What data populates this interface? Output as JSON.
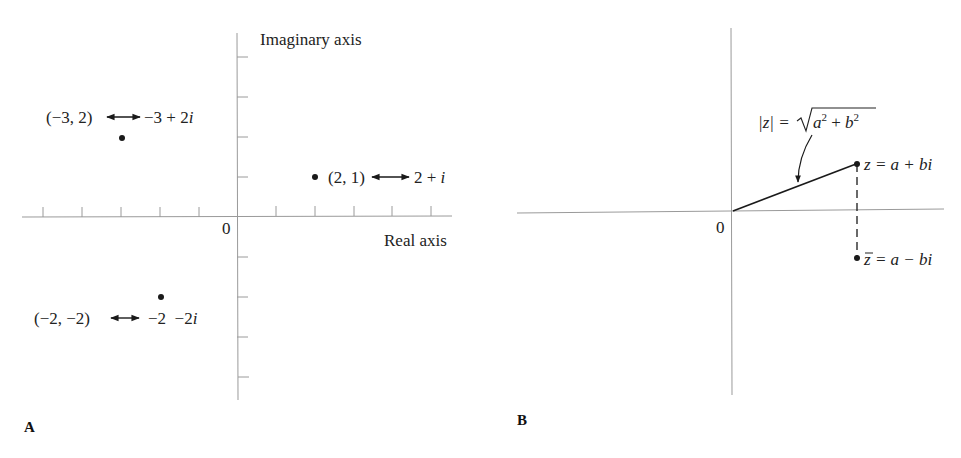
{
  "figure": {
    "panel_a": {
      "label": "A",
      "imaginary_axis_label": "Imaginary axis",
      "real_axis_label": "Real axis",
      "origin_label": "0",
      "real_ticks": [
        -5,
        -4,
        -3,
        -2,
        -1,
        1,
        2,
        3,
        4,
        5
      ],
      "imag_ticks": [
        4,
        3,
        2,
        1,
        -1,
        -2,
        -3,
        -4
      ],
      "points": [
        {
          "x": -3,
          "y": 2,
          "pair": "(−3, 2)",
          "complex_re": "−3 + 2",
          "complex_i": "i"
        },
        {
          "x": 2,
          "y": 1,
          "pair": "(2, 1)",
          "complex_re": "2 + ",
          "complex_i": "i"
        },
        {
          "x": -2,
          "y": -2,
          "pair": "(−2, −2)",
          "complex_re": "−2  −2",
          "complex_i": "i"
        }
      ]
    },
    "panel_b": {
      "label": "B",
      "origin_label": "0",
      "modulus_lhs": "|z| = ",
      "modulus_rhs_a": "a",
      "modulus_rhs_plus": " + ",
      "modulus_rhs_b": "b",
      "modulus_exp": "2",
      "z_label_var": "z",
      "z_label_rest": " = a + bi",
      "zbar_label_var": "z",
      "zbar_label_rest": " = a − bi"
    }
  },
  "colors": {
    "axis": "#9a9a9a",
    "ink": "#1a1a1a",
    "background": "#ffffff"
  }
}
